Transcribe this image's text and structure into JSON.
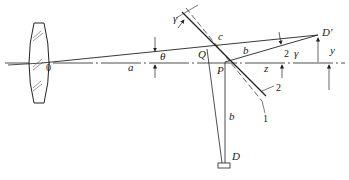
{
  "diagram": {
    "title": "",
    "labels": {
      "origin": "0",
      "a": "a",
      "theta": "θ",
      "Q": "Q",
      "P": "P",
      "c": "c",
      "b_upper": "b",
      "b_lower": "b",
      "z": "z",
      "gamma_top": "γ",
      "gamma_right": "γ",
      "two_angle": "2",
      "D_prime": "D′",
      "y": "y",
      "D": "D",
      "line1": "1",
      "line2": "2"
    },
    "elements": [
      {
        "id": "lens",
        "type": "biconvex-lens"
      },
      {
        "id": "optical-axis",
        "type": "dash-dot-line"
      },
      {
        "id": "mirror-1",
        "label": "1"
      },
      {
        "id": "mirror-2",
        "label": "2"
      },
      {
        "id": "detector-D",
        "label": "D"
      },
      {
        "id": "image-D-prime",
        "label": "D′"
      }
    ],
    "colors": {
      "stroke": "#222222",
      "background": "#ffffff"
    }
  }
}
